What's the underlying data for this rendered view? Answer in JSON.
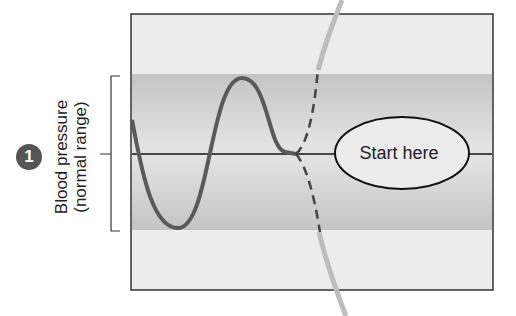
{
  "diagram": {
    "step_number": "1",
    "y_axis_label_line1": "Blood pressure",
    "y_axis_label_line2": "(normal range)",
    "start_label": "Start here",
    "colors": {
      "outer_region": "#ececec",
      "normal_band": "#c8c8c8",
      "curve": "#5a5a5a",
      "baseline": "#111111",
      "border": "#333333",
      "badge": "#555555"
    }
  }
}
